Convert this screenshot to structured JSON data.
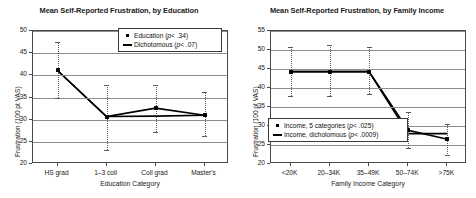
{
  "figure": {
    "background": "#ffffff",
    "series_color": "#000000",
    "errorbar_color": "#5a5a5a",
    "gridline_color": "#8d8d8d",
    "axis_color": "#4a4a4a"
  },
  "panels": [
    {
      "id": "education",
      "title": "Mean Self-Reported Frustration, by Education",
      "ylabel": "Frustration (100 pt VAS)",
      "xlabel": "Education Category",
      "yticks": [
        "20",
        "25",
        "30",
        "35",
        "40",
        "45",
        "50"
      ],
      "xticks": [
        "HS grad",
        "1–3 coll",
        "Coll grad",
        "Master's"
      ],
      "legend": [
        {
          "key": "dot",
          "label": "Education (",
          "p": "p",
          "rest": " < .34)"
        },
        {
          "key": "line",
          "label": "Dichotomous (",
          "p": "p",
          "rest": " < .07)"
        }
      ]
    },
    {
      "id": "family-income",
      "title": "Mean Self-Reported Frustration, by Family Income",
      "ylabel": "Frustration (100 pt VAS)",
      "xlabel": "Family Income Category",
      "yticks": [
        "20",
        "25",
        "30",
        "35",
        "40",
        "45",
        "50",
        "55"
      ],
      "xticks": [
        "<20K",
        "20–34K",
        "35–49K",
        "50–74K",
        ">75K"
      ],
      "legend": [
        {
          "key": "dot",
          "label": "Income, 5 categories (",
          "p": "p",
          "rest": " < .025)"
        },
        {
          "key": "line",
          "label": "Income, dicholomous (",
          "p": "p",
          "rest": " < .0009)"
        }
      ]
    }
  ],
  "chart_data": [
    {
      "type": "line",
      "title": "Mean Self-Reported Frustration, by Education",
      "xlabel": "Education Category",
      "ylabel": "Frustration (100 pt VAS)",
      "ylim": [
        20,
        50
      ],
      "yticks": [
        20,
        25,
        30,
        35,
        40,
        45,
        50
      ],
      "grid": true,
      "legend_position": "upper-right-inside",
      "categories": [
        "HS grad",
        "1–3 coll",
        "Coll grad",
        "Master's"
      ],
      "series": [
        {
          "name": "Education (p < .34)",
          "marker": "filled-square",
          "values": [
            41.1,
            30.7,
            32.6,
            31.0
          ],
          "error_low": [
            34.9,
            23.2,
            27.2,
            26.4
          ],
          "error_high": [
            47.6,
            37.8,
            37.9,
            36.2
          ]
        },
        {
          "name": "Dichotomous (p < .07)",
          "marker": "line",
          "values": [
            41.1,
            30.7,
            30.8,
            31.0
          ]
        }
      ]
    },
    {
      "type": "line",
      "title": "Mean Self-Reported Frustration, by Family Income",
      "xlabel": "Family Income Category",
      "ylabel": "Frustration (100 pt VAS)",
      "ylim": [
        20,
        55
      ],
      "yticks": [
        20,
        25,
        30,
        35,
        40,
        45,
        50,
        55
      ],
      "grid": true,
      "legend_position": "lower-left-inside",
      "categories": [
        "<20K",
        "20–34K",
        "35–49K",
        "50–74K",
        ">75K"
      ],
      "series": [
        {
          "name": "Income, 5 categories (p < .025)",
          "marker": "filled-square",
          "values": [
            44.3,
            44.3,
            44.3,
            28.9,
            26.5
          ],
          "error_low": [
            38.0,
            37.9,
            38.5,
            24.3,
            22.5
          ],
          "error_high": [
            50.8,
            51.4,
            50.8,
            33.6,
            30.4
          ]
        },
        {
          "name": "Income, dicholomous (p < .0009)",
          "marker": "line",
          "values": [
            44.3,
            44.3,
            44.3,
            28.0,
            28.0
          ]
        }
      ]
    }
  ]
}
